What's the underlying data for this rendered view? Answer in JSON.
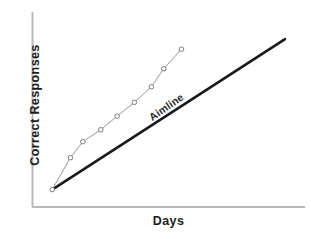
{
  "chart_data": {
    "type": "line",
    "title": "",
    "xlabel": "Days",
    "ylabel": "Correct Responses",
    "grid": false,
    "legend": "none",
    "axis_ticks": false,
    "xlim": [
      0,
      10
    ],
    "ylim": [
      0,
      10
    ],
    "series": [
      {
        "name": "Aimline",
        "style": "straight-reference-line",
        "color": "#1a1a1a",
        "line_width": 2.6,
        "markers": false,
        "label_text": "Aimline",
        "x": [
          0.42,
          10.0
        ],
        "y": [
          0.2,
          9.05
        ]
      },
      {
        "name": "Correct Responses",
        "style": "data-path",
        "color": "#8c8c8c",
        "line_width": 0.9,
        "markers": true,
        "marker_shape": "open-circle",
        "marker_color": "#ffffff",
        "marker_edge": "#6f6f6f",
        "x": [
          0.42,
          1.17,
          1.68,
          2.42,
          3.09,
          3.8,
          4.5,
          5.01,
          5.74
        ],
        "y": [
          0.2,
          2.08,
          3.02,
          3.72,
          4.52,
          5.33,
          6.25,
          7.31,
          8.46
        ]
      }
    ]
  },
  "axes": {
    "y_axis_label": "Correct Responses",
    "x_axis_label": "Days",
    "axis_color": "#b8b8b8"
  },
  "annotations": {
    "aimline_label": "Aimline"
  },
  "colors": {
    "background": "#ffffff",
    "aimline": "#1a1a1a",
    "data_line": "#8c8c8c",
    "axis": "#b8b8b8",
    "text": "#1c1c1c"
  }
}
